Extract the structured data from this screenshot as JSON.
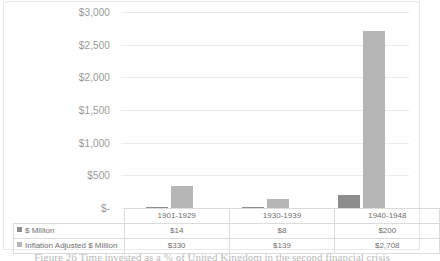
{
  "chart_data": {
    "type": "bar",
    "title": "",
    "xlabel": "",
    "ylabel": "",
    "ylim": [
      0,
      3000
    ],
    "grid": true,
    "legend_position": "data-table",
    "categories": [
      "1901-1929",
      "1930-1939",
      "1940-1948"
    ],
    "series": [
      {
        "name": "$ Million",
        "color": "#8d8d8d",
        "values": [
          14,
          8,
          200
        ],
        "labels": [
          "$14",
          "$8",
          "$200"
        ]
      },
      {
        "name": "Inflation Adjusted $ Million",
        "color": "#b6b6b6",
        "values": [
          330,
          139,
          2708
        ],
        "labels": [
          "$330",
          "$139",
          "$2,708"
        ]
      }
    ],
    "yticks": [
      {
        "value": 3000,
        "label": "$3,000"
      },
      {
        "value": 2500,
        "label": "$2,500"
      },
      {
        "value": 2000,
        "label": "$2,000"
      },
      {
        "value": 1500,
        "label": "$1,500"
      },
      {
        "value": 1000,
        "label": "$1,000"
      },
      {
        "value": 500,
        "label": "$500"
      },
      {
        "value": 0,
        "label": "$-"
      }
    ]
  },
  "caption": {
    "text": "Figure 26 Time invested as a % of United Kingdom in the second financial crisis"
  }
}
